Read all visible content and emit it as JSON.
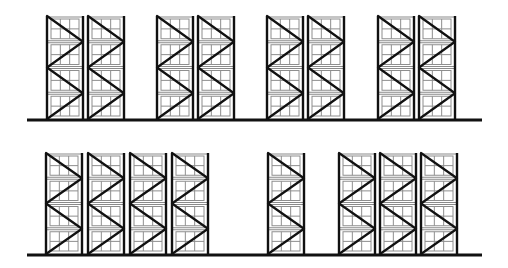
{
  "diagram": {
    "title": "",
    "colors": {
      "structure": "#111111",
      "pallet_grid": "#8e8e8e",
      "background": "#ffffff"
    },
    "rack": {
      "width": 36,
      "levels": 4,
      "grid_columns": 3,
      "grid_rows_per_level": 2,
      "bracing": "zig-zag"
    },
    "rows": [
      {
        "name": "top-row",
        "top_y": 16,
        "ground_y": 120,
        "ground_x": [
          27,
          482
        ],
        "groups": [
          {
            "name": "group-1",
            "rack_x": [
              47,
              88
            ]
          },
          {
            "name": "group-2",
            "rack_x": [
              157,
              198
            ]
          },
          {
            "name": "group-3",
            "rack_x": [
              267,
              308
            ]
          },
          {
            "name": "group-4",
            "rack_x": [
              378,
              419
            ]
          }
        ]
      },
      {
        "name": "bottom-row",
        "top_y": 153,
        "ground_y": 255,
        "ground_x": [
          27,
          482
        ],
        "groups": [
          {
            "name": "group-1",
            "rack_x": [
              46,
              88,
              130,
              172
            ]
          },
          {
            "name": "group-2",
            "rack_x": [
              268
            ]
          },
          {
            "name": "group-3",
            "rack_x": [
              339,
              380,
              421
            ]
          }
        ]
      }
    ]
  }
}
